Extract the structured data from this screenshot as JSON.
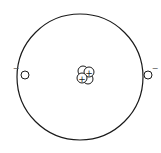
{
  "diagram": {
    "colors": {
      "stroke": "#1a1a1a",
      "fill": "#ffffff",
      "background": "#ffffff"
    },
    "orbit": {
      "cx": 80,
      "cy": 77,
      "r": 63
    },
    "electrons": [
      {
        "id": "electron-left",
        "cx": 25,
        "cy": 75,
        "r": 4,
        "charge_label": "−",
        "label_x": 16,
        "label_y": 71
      },
      {
        "id": "electron-right",
        "cx": 148,
        "cy": 75,
        "r": 4,
        "charge_label": "−",
        "label_x": 155,
        "label_y": 71
      }
    ],
    "nucleus": {
      "particles": [
        {
          "type": "neutron",
          "cx": 83,
          "cy": 71,
          "r": 5,
          "label": ""
        },
        {
          "type": "proton",
          "cx": 89,
          "cy": 72,
          "r": 5,
          "label": "+"
        },
        {
          "type": "proton",
          "cx": 82,
          "cy": 78,
          "r": 5,
          "label": "+"
        },
        {
          "type": "neutron",
          "cx": 88,
          "cy": 79,
          "r": 5,
          "label": ""
        }
      ]
    }
  }
}
